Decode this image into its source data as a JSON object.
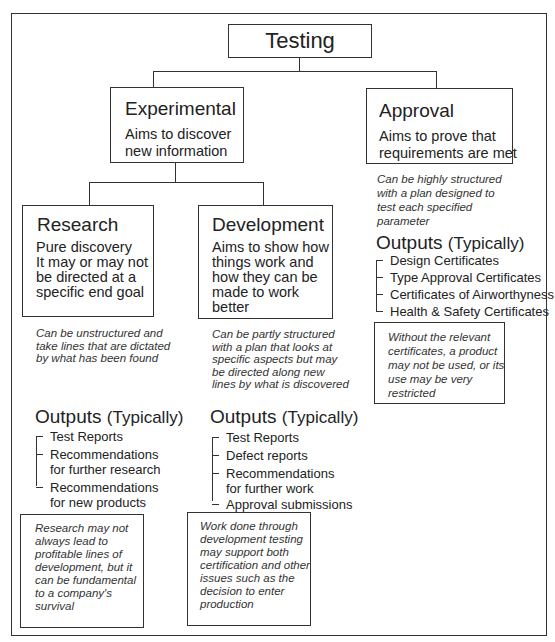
{
  "root": {
    "label": "Testing"
  },
  "experimental": {
    "title": "Experimental",
    "lines": [
      "Aims to discover",
      "new information"
    ]
  },
  "approval": {
    "title": "Approval",
    "lines": [
      "Aims to prove that",
      "requirements are met"
    ],
    "note": [
      "Can be highly structured",
      "with a plan designed to",
      "test each specified",
      "parameter"
    ],
    "outputs_heading": "Outputs",
    "outputs_sub": "(Typically)",
    "outputs": [
      "Design Certificates",
      "Type Approval Certificates",
      "Certificates of Airworthyness",
      "Health & Safety Certificates"
    ],
    "callout": [
      "Without the relevant",
      "certificates, a product",
      "may not be used, or its",
      "use may be very",
      "restricted"
    ]
  },
  "research": {
    "title": "Research",
    "lines": [
      "Pure discovery",
      "It may or may not",
      "be directed at a",
      "specific end goal"
    ],
    "note": [
      "Can be unstructured and",
      "take lines that are dictated",
      "by what has been found"
    ],
    "outputs_heading": "Outputs",
    "outputs_sub": "(Typically)",
    "outputs": [
      [
        "Test Reports"
      ],
      [
        "Recommendations",
        "for further research"
      ],
      [
        "Recommendations",
        "for new products"
      ]
    ],
    "callout": [
      "Research may not",
      "always lead to",
      "profitable lines of",
      "development, but it",
      "can be fundamental",
      "to a company's",
      "survival"
    ]
  },
  "development": {
    "title": "Development",
    "lines": [
      "Aims to show how",
      "things work and",
      "how they can be",
      "made to work",
      "better"
    ],
    "note": [
      "Can be partly structured",
      "with a plan that looks at",
      "specific aspects but may",
      "be directed along new",
      "lines by what is discovered"
    ],
    "outputs_heading": "Outputs",
    "outputs_sub": "(Typically)",
    "outputs": [
      [
        "Test Reports"
      ],
      [
        "Defect reports"
      ],
      [
        "Recommendations",
        "for further work"
      ],
      [
        "Approval submissions"
      ]
    ],
    "callout": [
      "Work done through",
      "development testing",
      "may support both",
      "certification and other",
      "issues such as the",
      "decision to enter",
      "production"
    ]
  }
}
